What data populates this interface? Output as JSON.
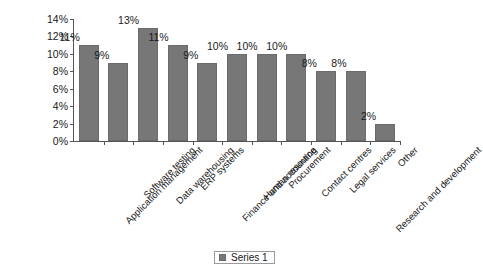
{
  "chart_data": {
    "type": "bar",
    "title": "",
    "subtitle": "",
    "xlabel": "",
    "ylabel": "",
    "ylim": [
      0,
      14
    ],
    "ytick_labels": [
      "0%",
      "2%",
      "4%",
      "6%",
      "8%",
      "10%",
      "12%",
      "14%"
    ],
    "ytick_values": [
      0,
      2,
      4,
      6,
      8,
      10,
      12,
      14
    ],
    "grid": false,
    "legend_position": "bottom",
    "legend": [
      "Series 1"
    ],
    "bar_color": "#777777",
    "categories": [
      "Application management",
      "Software testing",
      "Data warehousing",
      "ERP systems",
      "Finance and accounting",
      "Human resource",
      "Procurement",
      "Contact centres",
      "Legal services",
      "Research and development",
      "Other"
    ],
    "values": [
      11,
      9,
      13,
      11,
      9,
      10,
      10,
      10,
      8,
      8,
      2
    ],
    "data_labels": [
      "11%",
      "9%",
      "13%",
      "11%",
      "9%",
      "10%",
      "10%",
      "10%",
      "8%",
      "8%",
      "2%"
    ],
    "series": [
      {
        "name": "Series 1",
        "values": [
          11,
          9,
          13,
          11,
          9,
          10,
          10,
          10,
          8,
          8,
          2
        ]
      }
    ]
  },
  "legend": {
    "swatch_color": "#777777",
    "label": "Series 1"
  }
}
